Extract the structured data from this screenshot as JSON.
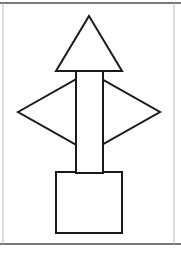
{
  "page": {
    "width": 181,
    "height": 257,
    "background_color": "#ffffff",
    "title": "Geometric line drawing"
  },
  "frame": {
    "rule_color": "#7a7a7a",
    "rule_thickness": 2,
    "top_rule_y": 3,
    "bottom_rule_y": 244,
    "left_edge_x": 3,
    "right_edge_x": 174,
    "edge_color": "#b8b8b8",
    "edge_thickness": 1
  },
  "drawing": {
    "stroke_color": "#1a1a1a",
    "fill_color": "#ffffff",
    "stroke_width": 2,
    "description": "Composite figure: triangle over vertical rectangle crossing a horizontal diamond above a square",
    "shapes": [
      {
        "name": "diamond",
        "type": "polygon",
        "label": "rhombus",
        "points": "18,112 89,72 160,112 89,152"
      },
      {
        "name": "square",
        "type": "rect",
        "label": "square",
        "x": 56,
        "y": 172,
        "width": 66,
        "height": 61
      },
      {
        "name": "pole",
        "type": "rect",
        "label": "vertical rectangle",
        "x": 76,
        "y": 70,
        "width": 27,
        "height": 103
      },
      {
        "name": "triangle",
        "type": "polygon",
        "label": "triangle",
        "points": "89,16 122,71 56,71"
      }
    ]
  },
  "chart_data": {
    "type": "scatter",
    "title": "Geometric line drawing",
    "xlabel": "",
    "ylabel": "",
    "xlim": [
      0,
      181
    ],
    "ylim": [
      0,
      257
    ],
    "grid": false,
    "legend": "none",
    "annotations": [
      "triangle apex at (89,16), base from (56,71) to (122,71)",
      "vertical rectangle from (76,70) to (103,173)",
      "diamond vertices at (18,112), (89,72), (160,112), (89,152)",
      "square from (56,172) to (122,233)"
    ],
    "series": [
      {
        "name": "triangle",
        "x": [
          89,
          122,
          56,
          89
        ],
        "y": [
          16,
          71,
          71,
          16
        ]
      },
      {
        "name": "vertical-rectangle",
        "x": [
          76,
          103,
          103,
          76,
          76
        ],
        "y": [
          70,
          70,
          173,
          173,
          70
        ]
      },
      {
        "name": "diamond",
        "x": [
          18,
          89,
          160,
          89,
          18
        ],
        "y": [
          112,
          72,
          112,
          152,
          112
        ]
      },
      {
        "name": "square",
        "x": [
          56,
          122,
          122,
          56,
          56
        ],
        "y": [
          172,
          172,
          233,
          233,
          172
        ]
      }
    ]
  }
}
